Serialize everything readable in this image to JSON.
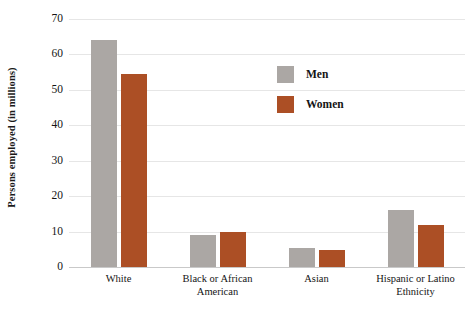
{
  "chart_data": {
    "type": "bar",
    "title": "",
    "subtitle": "",
    "xlabel": "",
    "ylabel": "Persons employed (in millions)",
    "ylim": [
      0,
      70
    ],
    "ytick_labels": [
      "70",
      "60",
      "50",
      "40",
      "30",
      "20",
      "10",
      "0"
    ],
    "ytick_values": [
      70,
      60,
      50,
      40,
      30,
      20,
      10,
      0
    ],
    "grid": true,
    "legend_position": "inside-upper-center",
    "categories": [
      "White",
      "Black or African American",
      "Asian",
      "Hispanic or Latino Ethnicity"
    ],
    "category_lines": [
      [
        "White"
      ],
      [
        "Black or African",
        "American"
      ],
      [
        "Asian"
      ],
      [
        "Hispanic or Latino",
        "Ethnicity"
      ]
    ],
    "series": [
      {
        "name": "Men",
        "color": "#aba7a4",
        "values": [
          64,
          9,
          5.5,
          16
        ]
      },
      {
        "name": "Women",
        "color": "#ac4f25",
        "values": [
          54.5,
          10,
          4.8,
          12
        ]
      }
    ]
  },
  "legend": {
    "items": [
      {
        "label": "Men",
        "color": "#aba7a4"
      },
      {
        "label": "Women",
        "color": "#ac4f25"
      }
    ]
  },
  "colors": {
    "men": "#aba7a4",
    "women": "#ac4f25",
    "gridline": "#e6e6e6",
    "axis": "#c9c9c9",
    "text": "#141414",
    "background": "#ffffff"
  }
}
